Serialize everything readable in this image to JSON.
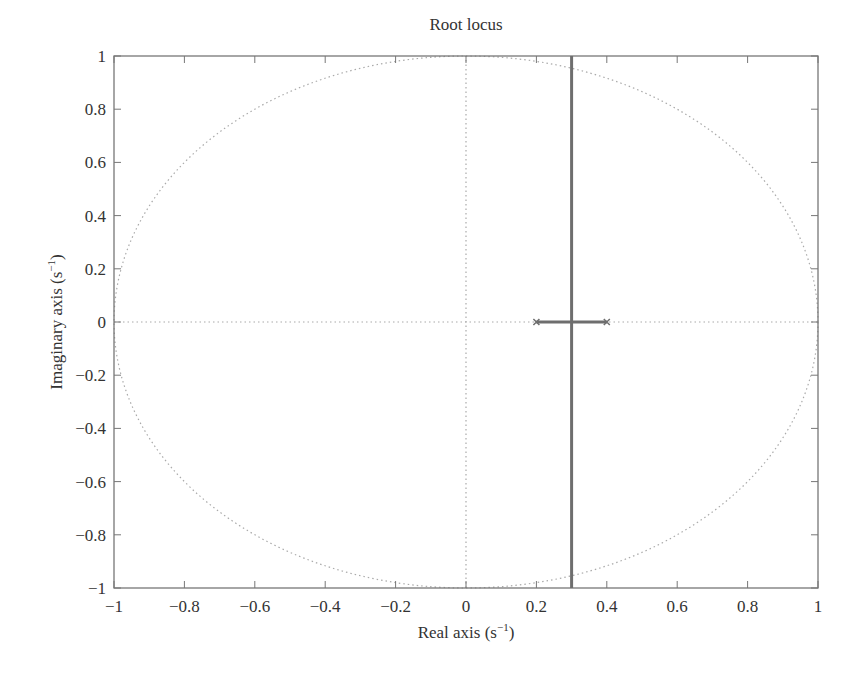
{
  "chart_data": {
    "type": "line",
    "title": "Root locus",
    "xlabel": "Real axis (s⁻¹)",
    "xlabel_base": "Real axis (s",
    "xlabel_sup": "−1",
    "ylabel_base": "Imaginary axis (s",
    "ylabel_sup": "−1",
    "ylabel": "Imaginary axis (s⁻¹)",
    "xlim": [
      -1,
      1
    ],
    "ylim": [
      -1,
      1
    ],
    "grid": false,
    "legend": null,
    "x_ticks": [
      -1,
      -0.8,
      -0.6,
      -0.4,
      -0.2,
      0,
      0.2,
      0.4,
      0.6,
      0.8,
      1
    ],
    "x_tick_labels": [
      "−1",
      "−0.8",
      "−0.6",
      "−0.4",
      "−0.2",
      "0",
      "0.2",
      "0.4",
      "0.6",
      "0.8",
      "1"
    ],
    "y_ticks": [
      1,
      0.8,
      0.6,
      0.4,
      0.2,
      0,
      -0.2,
      -0.4,
      -0.6,
      -0.8,
      -1
    ],
    "y_tick_labels": [
      "1",
      "0.8",
      "0.6",
      "0.4",
      "0.2",
      "0",
      "−0.2",
      "−0.4",
      "−0.6",
      "−0.8",
      "−1"
    ],
    "series": [
      {
        "name": "real-axis branch",
        "style": "solid",
        "color": "#6e6e6e",
        "x": [
          0.2,
          0.4
        ],
        "y": [
          0,
          0
        ]
      },
      {
        "name": "vertical branch",
        "style": "solid",
        "color": "#6e6e6e",
        "x": [
          0.3,
          0.3
        ],
        "y": [
          -1,
          1
        ]
      },
      {
        "name": "unit circle",
        "style": "dotted",
        "color": "#aaaaaa",
        "shape": "circle",
        "center": [
          0,
          0
        ],
        "radius": 1
      },
      {
        "name": "real axis reference",
        "style": "dotted",
        "color": "#aaaaaa",
        "x": [
          -1,
          1
        ],
        "y": [
          0,
          0
        ]
      },
      {
        "name": "imaginary axis reference",
        "style": "dotted",
        "color": "#aaaaaa",
        "x": [
          0,
          0
        ],
        "y": [
          -1,
          1
        ]
      }
    ],
    "markers": [
      {
        "type": "pole",
        "x": 0.2,
        "y": 0
      },
      {
        "type": "pole",
        "x": 0.4,
        "y": 0
      }
    ],
    "breakaway_point": [
      0.3,
      0
    ]
  },
  "colors": {
    "axes": "#777777",
    "locus": "#6e6e6e",
    "reference": "#aaaaaa",
    "text": "#333333"
  }
}
